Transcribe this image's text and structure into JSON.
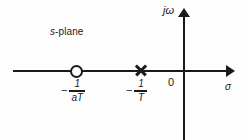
{
  "figure": {
    "background_color": "#fefefe",
    "ink_color": "#1a1a1a",
    "width": 243,
    "height": 140
  },
  "labels": {
    "plane": "s-plane",
    "plane_italic_part": "s",
    "plane_roman_part": "-plane",
    "imaginary_axis": "jω",
    "real_axis": "σ",
    "origin": "0"
  },
  "markers": [
    {
      "id": "zero",
      "glyph": "circle-open",
      "name": "zero-marker",
      "x_px": 76,
      "y_px": 71,
      "label_minus": "−",
      "label_numerator": "1",
      "label_denominator": "aT",
      "label_text": "−1/aT"
    },
    {
      "id": "pole",
      "glyph": "cross",
      "name": "pole-marker",
      "x_px": 140,
      "y_px": 70,
      "label_minus": "−",
      "label_numerator": "1",
      "label_denominator": "T",
      "label_text": "−1/T"
    }
  ],
  "chart_data": {
    "type": "scatter",
    "title": "s-plane",
    "xlabel": "σ",
    "ylabel": "jω",
    "grid": false,
    "legend": null,
    "axis_arrows": {
      "x": "right",
      "y": "up"
    },
    "series": [
      {
        "name": "zero",
        "marker": "open-circle",
        "points": [
          {
            "x_label": "−1/aT",
            "y_label": "0"
          }
        ]
      },
      {
        "name": "pole",
        "marker": "cross",
        "points": [
          {
            "x_label": "−1/T",
            "y_label": "0"
          }
        ]
      }
    ],
    "annotations": [
      "s-plane",
      "0",
      "−1/aT",
      "−1/T"
    ]
  }
}
